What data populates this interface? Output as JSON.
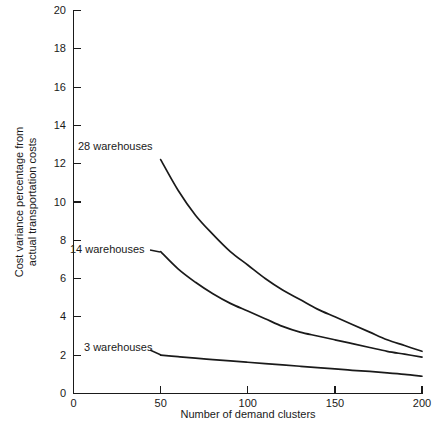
{
  "chart_data": {
    "type": "line",
    "title": "",
    "xlabel": "Number of demand clusters",
    "ylabel": "Cost variance percentage from actual transportation costs",
    "ylabel_line1": "Cost variance percentage from",
    "ylabel_line2": "actual transportation costs",
    "xlim": [
      0,
      200
    ],
    "ylim": [
      0,
      20
    ],
    "grid": false,
    "legend_position": "inline-labels",
    "xticks": [
      0,
      50,
      100,
      150,
      200
    ],
    "xtick_labels": [
      "0",
      "50",
      "100",
      "150",
      "200"
    ],
    "yticks": [
      0,
      2,
      4,
      6,
      8,
      10,
      12,
      14,
      16,
      18,
      20
    ],
    "ytick_labels": [
      "0",
      "2",
      "4",
      "6",
      "8",
      "10",
      "12",
      "14",
      "16",
      "18",
      "20"
    ],
    "x": [
      50,
      60,
      70,
      80,
      90,
      100,
      110,
      120,
      130,
      140,
      150,
      160,
      170,
      180,
      190,
      200
    ],
    "series": [
      {
        "name": "28 warehouses",
        "label": "28 warehouses",
        "values": [
          12.2,
          10.6,
          9.3,
          8.3,
          7.4,
          6.7,
          6.0,
          5.4,
          4.9,
          4.4,
          4.0,
          3.6,
          3.2,
          2.8,
          2.5,
          2.2
        ]
      },
      {
        "name": "14 warehouses",
        "label": "14 warehouses",
        "values": [
          7.4,
          6.5,
          5.8,
          5.2,
          4.7,
          4.3,
          3.9,
          3.5,
          3.2,
          3.0,
          2.8,
          2.6,
          2.4,
          2.2,
          2.05,
          1.9
        ]
      },
      {
        "name": "3 warehouses",
        "label": "3 warehouses",
        "values": [
          2.0,
          1.92,
          1.84,
          1.77,
          1.7,
          1.63,
          1.56,
          1.49,
          1.42,
          1.35,
          1.28,
          1.21,
          1.15,
          1.08,
          1.0,
          0.9
        ]
      }
    ]
  }
}
